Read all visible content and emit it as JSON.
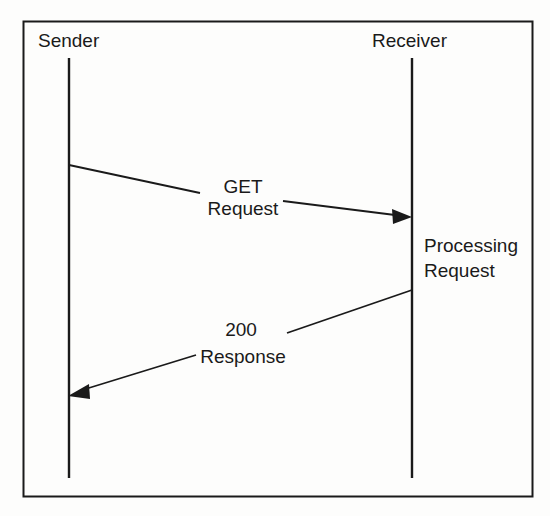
{
  "diagram": {
    "type": "sequence-diagram",
    "frame": {
      "border_color": "#1a1a1a",
      "background_color": "#fdfdfc",
      "x": 23,
      "y": 21,
      "width": 510,
      "height": 476
    },
    "participants": [
      {
        "id": "sender",
        "label": "Sender",
        "label_x": 38,
        "label_y": 42,
        "lifeline_x": 69,
        "lifeline_top": 58,
        "lifeline_bottom": 478
      },
      {
        "id": "receiver",
        "label": "Receiver",
        "label_x": 372,
        "label_y": 42,
        "lifeline_x": 412,
        "lifeline_top": 58,
        "lifeline_bottom": 478
      }
    ],
    "messages": [
      {
        "id": "get-request",
        "from": "sender",
        "to": "receiver",
        "direction": "right",
        "label_lines": [
          "GET",
          "Request"
        ],
        "label_line1": "GET",
        "label_line2": "Request",
        "label_line1_x": 243,
        "label_line1_y": 188,
        "label_line2_x": 243,
        "label_line2_y": 210,
        "segment1": {
          "x1": 69,
          "y1": 165,
          "x2": 200,
          "y2": 193
        },
        "segment2": {
          "x1": 283,
          "y1": 201,
          "x2": 409,
          "y2": 217
        },
        "arrow_tip": {
          "x": 412,
          "y": 217
        }
      },
      {
        "id": "200-response",
        "from": "receiver",
        "to": "sender",
        "direction": "left",
        "label_lines": [
          "200",
          "Response"
        ],
        "label_line1": "200",
        "label_line2": "Response",
        "label_line1_x": 241,
        "label_line1_y": 331,
        "label_line2_x": 243,
        "label_line2_y": 358,
        "segment1": {
          "x1": 412,
          "y1": 290,
          "x2": 287,
          "y2": 333
        },
        "segment2": {
          "x1": 196,
          "y1": 355,
          "x2": 72,
          "y2": 394
        },
        "arrow_tip": {
          "x": 68,
          "y": 396
        }
      }
    ],
    "annotations": [
      {
        "id": "processing-request",
        "attached_to": "receiver",
        "label_lines": [
          "Processing",
          "Request"
        ],
        "label_line1": "Processing",
        "label_line2": "Request",
        "label_line1_x": 424,
        "label_line1_y": 247,
        "label_line2_x": 424,
        "label_line2_y": 272
      }
    ],
    "colors": {
      "line": "#1a1a1a",
      "text": "#1a1a1a",
      "page_background": "#ffffff"
    }
  }
}
